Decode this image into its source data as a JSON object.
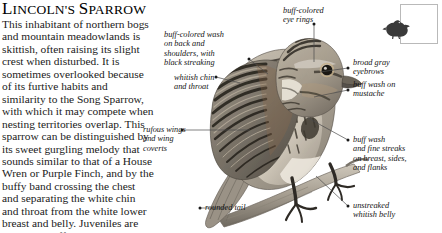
{
  "page": {
    "title_full": "LINCOLN'S SPARROW",
    "title_parts": [
      "L",
      "INCOLN'S ",
      "S",
      "PARROW"
    ],
    "background_color": "#ffffff",
    "text_color": "#111111"
  },
  "article": {
    "body": "This inhabitant of northern bogs and mountain meadowlands is skittish, often raising its slight crest when disturbed. It is sometimes overlooked because of its furtive habits and similarity to the Song Sparrow, with which it may compete when nesting territories overlap. This sparrow can be distinguished by its sweet gurgling melody that sounds similar to that of a House Wren or Purple Finch, and by the buffy band crossing the chest and separating the white chin and throat from the white lower breast and belly. Juveniles are paler and buffier overall with more streaking on their underparts."
  },
  "illustration": {
    "subject": "lincolns-sparrow-perched-on-branch",
    "size_reference": {
      "label": "size-reference-box",
      "silhouette": "sparrow-silhouette"
    }
  },
  "annotations": [
    {
      "id": "buff-colored-wash-back-shoulders",
      "text": "buff-colored wash\non back and\nshoulders, with\nblack streaking",
      "side": "left"
    },
    {
      "id": "buff-colored-eye-rings",
      "text": "buff-colored\neye rings",
      "side": "top"
    },
    {
      "id": "whitish-chin-and-throat",
      "text": "whitish chin\nand throat",
      "side": "left"
    },
    {
      "id": "broad-gray-eyebrows",
      "text": "broad gray\neyebrows",
      "side": "right"
    },
    {
      "id": "buff-wash-on-mustache",
      "text": "buff wash on\nmustache",
      "side": "right"
    },
    {
      "id": "rufous-wings-and-wing-coverts",
      "text": "rufous wings\nand wing\ncoverts",
      "side": "left"
    },
    {
      "id": "buff-wash-and-fine-streaks",
      "text": "buff wash\nand fine streaks\non breast, sides,\nand flanks",
      "side": "right"
    },
    {
      "id": "rounded-tail",
      "text": "rounded tail",
      "side": "bottom-left"
    },
    {
      "id": "unstreaked-whitish-belly",
      "text": "unstreaked\nwhitish belly",
      "side": "bottom-right"
    }
  ]
}
